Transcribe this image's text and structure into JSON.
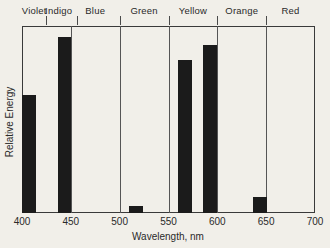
{
  "figure": {
    "xlabel": "Wavelength, nm",
    "ylabel": "Relative Energy"
  },
  "chart_data": {
    "type": "bar",
    "title": "",
    "xlabel": "Wavelength, nm",
    "ylabel": "Relative Energy",
    "xlim": [
      400,
      700
    ],
    "ylim": [
      0,
      1
    ],
    "grid": false,
    "legend": "none",
    "x_ticks": [
      400,
      450,
      500,
      550,
      600,
      650,
      700
    ],
    "spectral_regions": [
      {
        "label": "Violet",
        "start_nm": 400,
        "end_nm": 425
      },
      {
        "label": "Indigo",
        "start_nm": 425,
        "end_nm": 450
      },
      {
        "label": "Blue",
        "start_nm": 450,
        "end_nm": 500
      },
      {
        "label": "Green",
        "start_nm": 500,
        "end_nm": 550
      },
      {
        "label": "Yellow",
        "start_nm": 550,
        "end_nm": 600
      },
      {
        "label": "Orange",
        "start_nm": 600,
        "end_nm": 650
      },
      {
        "label": "Red",
        "start_nm": 650,
        "end_nm": 700
      }
    ],
    "region_boundary_lines_nm": [
      450,
      500,
      550,
      600,
      650
    ],
    "bars": [
      {
        "center_nm": 407,
        "start_nm": 400,
        "end_nm": 414,
        "relative_energy": 0.63
      },
      {
        "center_nm": 443,
        "start_nm": 437,
        "end_nm": 450,
        "relative_energy": 0.94
      },
      {
        "center_nm": 517,
        "start_nm": 510,
        "end_nm": 524,
        "relative_energy": 0.035
      },
      {
        "center_nm": 567,
        "start_nm": 560,
        "end_nm": 574,
        "relative_energy": 0.82
      },
      {
        "center_nm": 592,
        "start_nm": 585,
        "end_nm": 600,
        "relative_energy": 0.9
      },
      {
        "center_nm": 644,
        "start_nm": 637,
        "end_nm": 651,
        "relative_energy": 0.085
      }
    ],
    "colors": {
      "bar": "#1b1b1b",
      "axis": "#3a3a3a",
      "boundary_line": "#555555",
      "background": "#f1efe9",
      "text": "#2a2a2a"
    }
  }
}
